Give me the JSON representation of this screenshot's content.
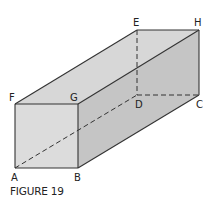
{
  "figure": {
    "caption": "FIGURE 19",
    "type": "rectangular prism (box) with hidden edges dashed",
    "vertices": {
      "A": "A",
      "B": "B",
      "C": "C",
      "D": "D",
      "E": "E",
      "F": "F",
      "G": "G",
      "H": "H"
    },
    "diagonal": "A to H (dashed, through interior)",
    "colors": {
      "front_face": "#dcdcdc",
      "top_face": "#d7d7d7",
      "side_face": "#c5c5c5",
      "edge": "#333333",
      "background": "#ffffff"
    }
  }
}
